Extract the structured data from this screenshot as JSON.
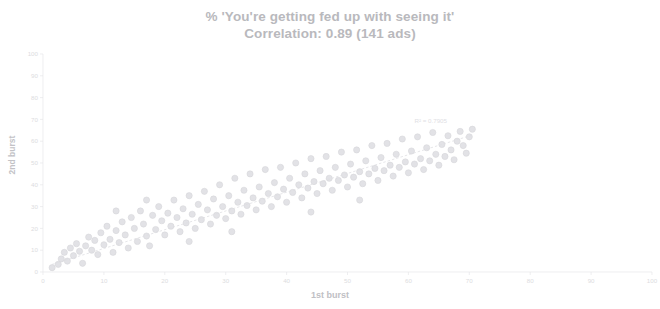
{
  "chart_data": {
    "type": "scatter",
    "title": "% 'You're getting fed up with seeing it'",
    "subtitle": "Correlation: 0.89 (141 ads)",
    "xlabel": "1st burst",
    "ylabel": "2nd burst",
    "xlim": [
      0,
      100
    ],
    "ylim": [
      0,
      100
    ],
    "xticks": [
      0,
      10,
      20,
      30,
      40,
      50,
      60,
      70,
      80,
      90,
      100
    ],
    "yticks": [
      0,
      10,
      20,
      30,
      40,
      50,
      60,
      70,
      80,
      90,
      100
    ],
    "xtick_labels": [
      "0",
      "10",
      "20",
      "30",
      "40",
      "50",
      "60",
      "70",
      "80",
      "90",
      "100"
    ],
    "ytick_labels": [
      "0",
      "10",
      "20",
      "30",
      "40",
      "50",
      "60",
      "70",
      "80",
      "90",
      "100"
    ],
    "grid": false,
    "legend": "none",
    "n_points": 141,
    "correlation": 0.89,
    "trendline": {
      "type": "linear",
      "label": "R² = 0.7905",
      "r_squared": 0.7905,
      "slope": 0.86,
      "intercept": 2.2,
      "x_start": 1.5,
      "x_end": 70.5,
      "color": "#dddde1",
      "style": "dashed"
    },
    "marker": {
      "shape": "circle",
      "color": "#e2e2e6",
      "edge_color": "#d4d4d9",
      "size": 3.1
    },
    "points": [
      [
        1.5,
        2.0
      ],
      [
        2.5,
        3.5
      ],
      [
        3.0,
        6.0
      ],
      [
        3.5,
        9.0
      ],
      [
        4.0,
        5.0
      ],
      [
        4.5,
        11.0
      ],
      [
        5.0,
        7.5
      ],
      [
        5.5,
        13.0
      ],
      [
        6.0,
        9.5
      ],
      [
        6.5,
        4.0
      ],
      [
        7.0,
        12.0
      ],
      [
        7.5,
        16.0
      ],
      [
        8.0,
        10.0
      ],
      [
        8.5,
        14.5
      ],
      [
        9.0,
        8.0
      ],
      [
        9.5,
        18.0
      ],
      [
        10.0,
        12.5
      ],
      [
        10.5,
        21.0
      ],
      [
        11.0,
        15.0
      ],
      [
        11.5,
        9.0
      ],
      [
        12.0,
        19.0
      ],
      [
        12.5,
        13.5
      ],
      [
        13.0,
        23.0
      ],
      [
        13.5,
        17.0
      ],
      [
        14.0,
        11.0
      ],
      [
        14.5,
        25.0
      ],
      [
        15.0,
        20.0
      ],
      [
        15.5,
        14.0
      ],
      [
        16.0,
        28.0
      ],
      [
        16.5,
        22.0
      ],
      [
        17.0,
        16.5
      ],
      [
        17.5,
        12.0
      ],
      [
        18.0,
        26.0
      ],
      [
        18.5,
        19.5
      ],
      [
        19.0,
        30.0
      ],
      [
        19.5,
        23.5
      ],
      [
        20.0,
        17.0
      ],
      [
        20.5,
        27.0
      ],
      [
        21.0,
        21.0
      ],
      [
        21.5,
        33.0
      ],
      [
        22.0,
        25.0
      ],
      [
        22.5,
        18.5
      ],
      [
        23.0,
        29.0
      ],
      [
        23.5,
        22.5
      ],
      [
        24.0,
        35.0
      ],
      [
        24.5,
        26.5
      ],
      [
        25.0,
        20.0
      ],
      [
        25.5,
        31.0
      ],
      [
        26.0,
        24.0
      ],
      [
        26.5,
        37.0
      ],
      [
        27.0,
        28.5
      ],
      [
        27.5,
        22.0
      ],
      [
        28.0,
        33.5
      ],
      [
        28.5,
        26.0
      ],
      [
        29.0,
        40.0
      ],
      [
        29.5,
        30.0
      ],
      [
        30.0,
        24.5
      ],
      [
        30.5,
        35.0
      ],
      [
        31.0,
        28.0
      ],
      [
        31.5,
        43.0
      ],
      [
        32.0,
        32.0
      ],
      [
        32.5,
        26.5
      ],
      [
        33.0,
        37.5
      ],
      [
        33.5,
        30.5
      ],
      [
        34.0,
        45.0
      ],
      [
        34.5,
        34.0
      ],
      [
        35.0,
        28.5
      ],
      [
        35.5,
        39.0
      ],
      [
        36.0,
        32.5
      ],
      [
        36.5,
        47.0
      ],
      [
        37.0,
        36.0
      ],
      [
        37.5,
        30.0
      ],
      [
        38.0,
        41.0
      ],
      [
        38.5,
        34.5
      ],
      [
        39.0,
        48.0
      ],
      [
        39.5,
        38.0
      ],
      [
        40.0,
        32.0
      ],
      [
        40.5,
        43.0
      ],
      [
        41.0,
        36.5
      ],
      [
        41.5,
        50.0
      ],
      [
        42.0,
        40.0
      ],
      [
        42.5,
        34.0
      ],
      [
        43.0,
        45.0
      ],
      [
        43.5,
        38.5
      ],
      [
        44.0,
        52.0
      ],
      [
        44.5,
        41.5
      ],
      [
        45.0,
        36.0
      ],
      [
        45.5,
        46.5
      ],
      [
        46.0,
        40.5
      ],
      [
        46.5,
        53.0
      ],
      [
        47.0,
        43.0
      ],
      [
        47.5,
        37.5
      ],
      [
        48.0,
        48.0
      ],
      [
        48.5,
        42.0
      ],
      [
        49.0,
        55.0
      ],
      [
        49.5,
        44.5
      ],
      [
        50.0,
        39.0
      ],
      [
        50.5,
        49.5
      ],
      [
        51.0,
        43.5
      ],
      [
        51.5,
        56.0
      ],
      [
        52.0,
        46.0
      ],
      [
        52.5,
        40.5
      ],
      [
        53.0,
        51.0
      ],
      [
        53.5,
        45.0
      ],
      [
        54.0,
        58.0
      ],
      [
        54.5,
        47.5
      ],
      [
        55.0,
        42.0
      ],
      [
        55.5,
        52.5
      ],
      [
        56.0,
        46.5
      ],
      [
        56.5,
        59.0
      ],
      [
        57.0,
        49.0
      ],
      [
        57.5,
        44.0
      ],
      [
        58.0,
        54.0
      ],
      [
        58.5,
        48.0
      ],
      [
        59.0,
        61.0
      ],
      [
        59.5,
        50.5
      ],
      [
        60.0,
        45.5
      ],
      [
        60.5,
        55.5
      ],
      [
        61.0,
        49.5
      ],
      [
        61.5,
        62.0
      ],
      [
        62.0,
        52.0
      ],
      [
        62.5,
        47.0
      ],
      [
        63.0,
        57.0
      ],
      [
        63.5,
        51.0
      ],
      [
        64.0,
        64.0
      ],
      [
        64.5,
        54.0
      ],
      [
        65.0,
        49.0
      ],
      [
        65.5,
        58.5
      ],
      [
        66.0,
        53.0
      ],
      [
        66.5,
        62.5
      ],
      [
        67.0,
        56.0
      ],
      [
        67.5,
        51.5
      ],
      [
        68.0,
        60.0
      ],
      [
        68.5,
        64.5
      ],
      [
        69.0,
        58.0
      ],
      [
        69.5,
        54.5
      ],
      [
        70.0,
        62.0
      ],
      [
        70.5,
        65.5
      ],
      [
        12.0,
        28.0
      ],
      [
        17.0,
        33.0
      ],
      [
        24.0,
        14.0
      ],
      [
        31.0,
        18.5
      ],
      [
        44.0,
        27.5
      ],
      [
        52.0,
        33.0
      ]
    ]
  }
}
